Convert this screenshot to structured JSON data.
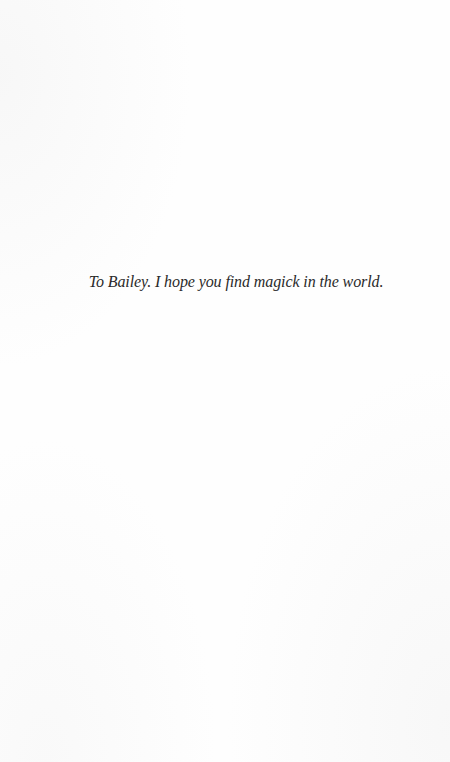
{
  "page": {
    "type": "dedication",
    "background_color": "#fefefe"
  },
  "dedication": {
    "text": "To Bailey. I hope you find magick in the world."
  }
}
